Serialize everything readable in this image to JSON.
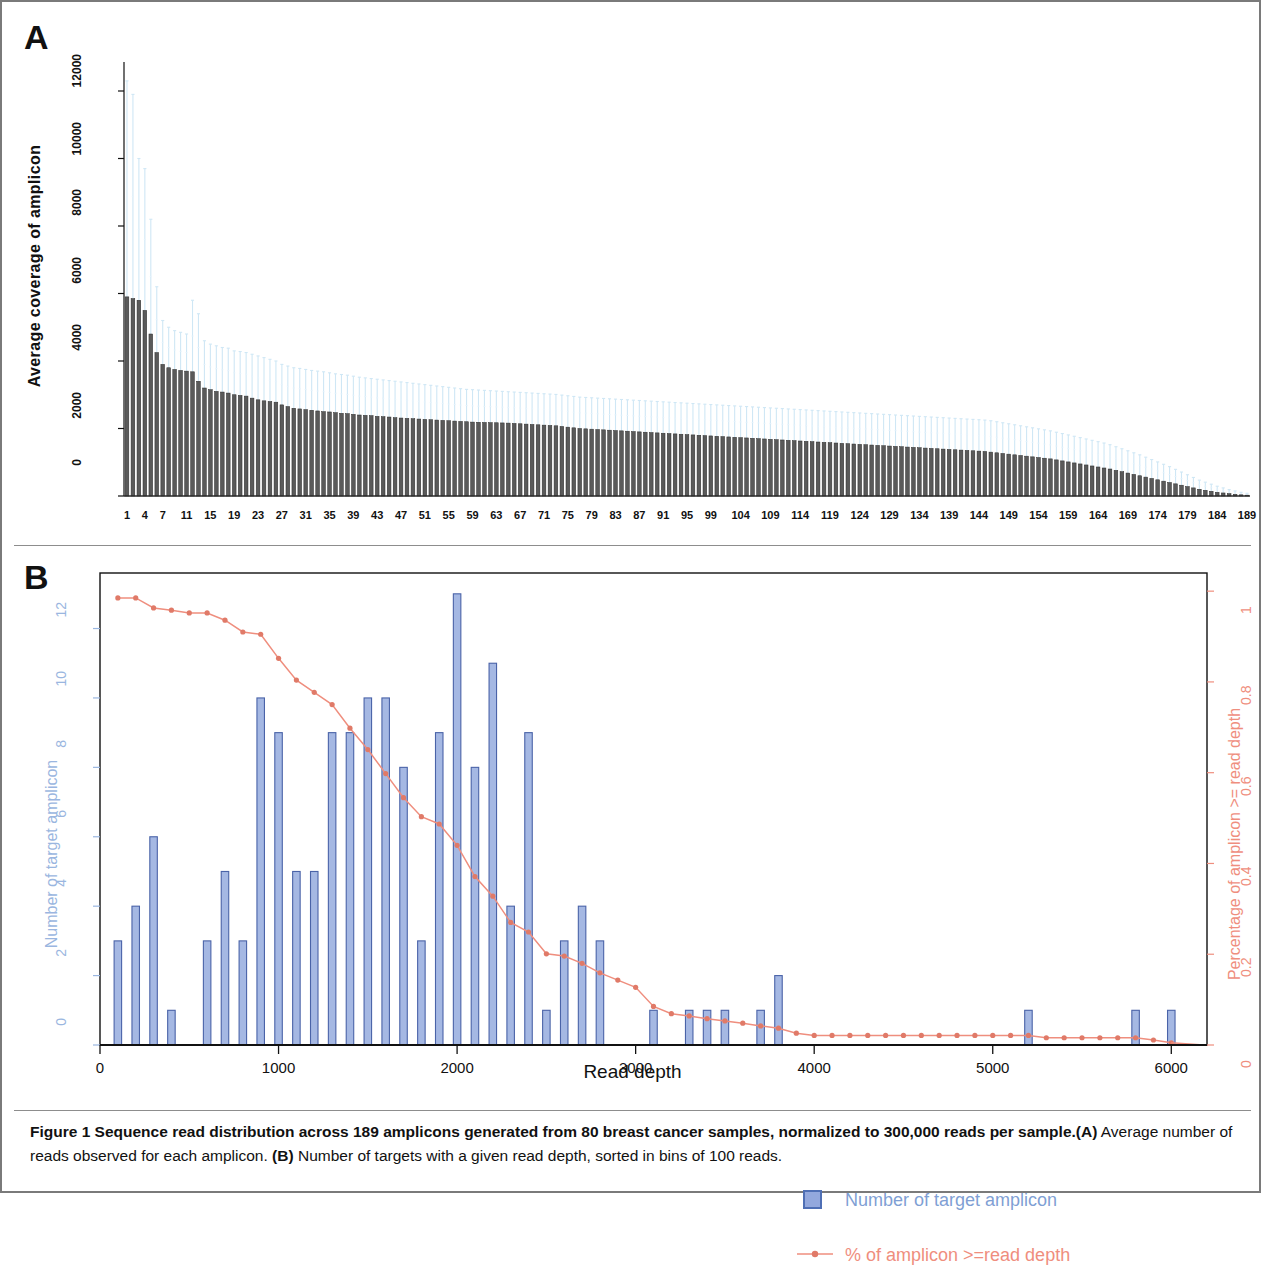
{
  "figure": {
    "panel_a_letter": "A",
    "panel_b_letter": "B",
    "caption_bold": "Figure 1 Sequence read distribution across 189 amplicons generated from 80 breast cancer samples, normalized to 300,000 reads per sample.",
    "caption_part_a_tag": "(A)",
    "caption_part_a_text": " Average number of reads observed for each amplicon. ",
    "caption_part_b_tag": "(B)",
    "caption_part_b_text": " Number of targets with a given read depth, sorted in bins of 100 reads."
  },
  "colors": {
    "bar_fill_a": "#4a4a4a",
    "errorbar_a": "#cfe4f2",
    "bar_fill_b": "#9fb4e2",
    "bar_border_b": "#4a63a8",
    "line_b": "#ef8e7e",
    "axis_left_b": "#9ab6e0",
    "axis_right_b": "#ef8e7e",
    "frame": "#7a7a7a"
  },
  "legend": {
    "bar_label": "Number of target amplicon",
    "line_label": "% of amplicon >=read depth",
    "bar_swatch_icon": "blue-square-icon",
    "line_swatch_icon": "line-with-point-icon"
  },
  "chart_data": [
    {
      "type": "bar",
      "id": "panel-a",
      "title": "",
      "xlabel": "",
      "ylabel": "Average coverage of amplicon",
      "ylim": [
        0,
        12800
      ],
      "yticks": [
        0,
        2000,
        4000,
        6000,
        8000,
        10000,
        12000
      ],
      "ytick_labels": [
        "0",
        "2000",
        "4000",
        "6000",
        "8000",
        "10000",
        "12000"
      ],
      "grid": false,
      "legend_position": "none",
      "error_bars": true,
      "error_bar_note": "Light blue vertical error bars (standard deviation) extend above each bar, reaching up to ~12000 for the first amplicons.",
      "xtick_labels": [
        "1",
        "4",
        "7",
        "11",
        "15",
        "19",
        "23",
        "27",
        "31",
        "35",
        "39",
        "43",
        "47",
        "51",
        "55",
        "59",
        "63",
        "67",
        "71",
        "75",
        "79",
        "83",
        "87",
        "91",
        "95",
        "99",
        "104",
        "109",
        "114",
        "119",
        "124",
        "129",
        "134",
        "139",
        "144",
        "149",
        "154",
        "159",
        "164",
        "169",
        "174",
        "179",
        "184",
        "189"
      ],
      "xtick_values": [
        1,
        4,
        7,
        11,
        15,
        19,
        23,
        27,
        31,
        35,
        39,
        43,
        47,
        51,
        55,
        59,
        63,
        67,
        71,
        75,
        79,
        83,
        87,
        91,
        95,
        99,
        104,
        109,
        114,
        119,
        124,
        129,
        134,
        139,
        144,
        149,
        154,
        159,
        164,
        169,
        174,
        179,
        184,
        189
      ],
      "categories_count": 189,
      "values": [
        5900,
        5850,
        5800,
        5500,
        4800,
        4250,
        3900,
        3800,
        3750,
        3720,
        3700,
        3680,
        3400,
        3200,
        3150,
        3100,
        3080,
        3050,
        3000,
        2980,
        2960,
        2900,
        2850,
        2820,
        2800,
        2780,
        2700,
        2650,
        2600,
        2580,
        2560,
        2540,
        2520,
        2500,
        2490,
        2470,
        2450,
        2440,
        2420,
        2400,
        2390,
        2380,
        2360,
        2350,
        2340,
        2320,
        2310,
        2300,
        2290,
        2280,
        2270,
        2260,
        2250,
        2240,
        2230,
        2220,
        2210,
        2200,
        2190,
        2185,
        2180,
        2175,
        2170,
        2165,
        2160,
        2150,
        2140,
        2130,
        2120,
        2110,
        2100,
        2090,
        2080,
        2060,
        2040,
        2020,
        2000,
        1990,
        1980,
        1970,
        1960,
        1950,
        1940,
        1930,
        1920,
        1910,
        1900,
        1890,
        1880,
        1870,
        1860,
        1850,
        1840,
        1830,
        1820,
        1810,
        1800,
        1790,
        1780,
        1770,
        1760,
        1750,
        1740,
        1730,
        1720,
        1710,
        1700,
        1690,
        1680,
        1670,
        1660,
        1650,
        1640,
        1630,
        1620,
        1610,
        1600,
        1590,
        1580,
        1570,
        1560,
        1550,
        1540,
        1530,
        1520,
        1510,
        1500,
        1490,
        1480,
        1470,
        1460,
        1450,
        1440,
        1430,
        1420,
        1410,
        1400,
        1390,
        1380,
        1370,
        1360,
        1350,
        1340,
        1330,
        1320,
        1300,
        1280,
        1260,
        1240,
        1220,
        1200,
        1180,
        1160,
        1140,
        1120,
        1100,
        1070,
        1040,
        1010,
        980,
        950,
        920,
        890,
        860,
        830,
        800,
        760,
        720,
        680,
        640,
        600,
        560,
        520,
        480,
        440,
        400,
        360,
        320,
        280,
        240,
        200,
        170,
        140,
        110,
        90,
        70,
        50,
        35,
        25
      ],
      "errors_upper": [
        12300,
        11900,
        10000,
        9700,
        8200,
        6200,
        5200,
        5000,
        4900,
        4850,
        4800,
        5800,
        5400,
        4600,
        4500,
        4450,
        4400,
        4380,
        4300,
        4280,
        4250,
        4200,
        4150,
        4100,
        4050,
        4000,
        3900,
        3850,
        3800,
        3780,
        3750,
        3720,
        3700,
        3680,
        3650,
        3620,
        3600,
        3580,
        3550,
        3520,
        3500,
        3480,
        3460,
        3440,
        3420,
        3400,
        3380,
        3360,
        3340,
        3320,
        3300,
        3280,
        3260,
        3240,
        3220,
        3200,
        3180,
        3160,
        3150,
        3140,
        3130,
        3120,
        3110,
        3100,
        3090,
        3080,
        3070,
        3060,
        3050,
        3040,
        3030,
        3020,
        3010,
        2990,
        2970,
        2950,
        2930,
        2920,
        2910,
        2900,
        2890,
        2880,
        2870,
        2860,
        2850,
        2840,
        2830,
        2820,
        2810,
        2800,
        2790,
        2780,
        2770,
        2760,
        2750,
        2740,
        2730,
        2720,
        2710,
        2700,
        2690,
        2680,
        2670,
        2660,
        2650,
        2640,
        2630,
        2620,
        2610,
        2600,
        2590,
        2580,
        2570,
        2560,
        2550,
        2540,
        2530,
        2520,
        2510,
        2500,
        2490,
        2480,
        2470,
        2460,
        2450,
        2440,
        2430,
        2420,
        2410,
        2400,
        2390,
        2380,
        2370,
        2360,
        2350,
        2340,
        2330,
        2320,
        2310,
        2300,
        2290,
        2280,
        2270,
        2260,
        2250,
        2230,
        2200,
        2170,
        2140,
        2110,
        2080,
        2050,
        2020,
        1990,
        1960,
        1930,
        1890,
        1850,
        1810,
        1770,
        1730,
        1690,
        1650,
        1610,
        1570,
        1520,
        1460,
        1400,
        1340,
        1280,
        1220,
        1150,
        1080,
        1010,
        940,
        870,
        790,
        710,
        630,
        550,
        470,
        410,
        350,
        290,
        240,
        190,
        150,
        110,
        80
      ]
    },
    {
      "type": "bar",
      "id": "panel-b",
      "title": "",
      "xlabel": "Read depth",
      "ylabel": "Number of target amplicon",
      "ylabel_right": "Percentage of amplicon >= read depth",
      "xlim": [
        0,
        6200
      ],
      "ylim": [
        0,
        13.6
      ],
      "ylim_right": [
        0,
        1.04
      ],
      "xticks": [
        0,
        1000,
        2000,
        3000,
        4000,
        5000,
        6000
      ],
      "xtick_labels": [
        "0",
        "1000",
        "2000",
        "3000",
        "4000",
        "5000",
        "6000"
      ],
      "yticks": [
        0,
        2,
        4,
        6,
        8,
        10,
        12
      ],
      "ytick_labels": [
        "0",
        "2",
        "4",
        "6",
        "8",
        "10",
        "12"
      ],
      "yticks_right": [
        0,
        0.2,
        0.4,
        0.6,
        0.8,
        1
      ],
      "ytick_labels_right": [
        "0",
        "0.2",
        "0.4",
        "0.6",
        "0.8",
        "1"
      ],
      "grid": false,
      "legend_position": "upper-right-inside",
      "bin_width": 100,
      "bins": [
        100,
        200,
        300,
        400,
        500,
        600,
        700,
        800,
        900,
        1000,
        1100,
        1200,
        1300,
        1400,
        1500,
        1600,
        1700,
        1800,
        1900,
        2000,
        2100,
        2200,
        2300,
        2400,
        2500,
        2600,
        2700,
        2800,
        2900,
        3000,
        3100,
        3200,
        3300,
        3400,
        3500,
        3600,
        3700,
        3800,
        3900,
        4000,
        4100,
        4200,
        4300,
        4400,
        4500,
        4600,
        4700,
        4800,
        4900,
        5000,
        5100,
        5200,
        5300,
        5400,
        5500,
        5600,
        5700,
        5800,
        5900,
        6000
      ],
      "values": [
        3,
        4,
        6,
        1,
        0,
        3,
        5,
        3,
        10,
        9,
        5,
        5,
        9,
        9,
        10,
        10,
        8,
        3,
        9,
        13,
        8,
        11,
        4,
        9,
        1,
        3,
        4,
        3,
        0,
        0,
        1,
        0,
        1,
        1,
        1,
        0,
        1,
        2,
        0,
        0,
        0,
        0,
        0,
        0,
        0,
        0,
        0,
        0,
        0,
        0,
        0,
        1,
        0,
        0,
        0,
        0,
        0,
        1,
        0,
        1
      ],
      "series": [
        {
          "name": "Number of target amplicon",
          "type": "bar",
          "axis": "left",
          "color": "#9fb4e2",
          "values": [
            3,
            4,
            6,
            1,
            0,
            3,
            5,
            3,
            10,
            9,
            5,
            5,
            9,
            9,
            10,
            10,
            8,
            3,
            9,
            13,
            8,
            11,
            4,
            9,
            1,
            3,
            4,
            3,
            0,
            0,
            1,
            0,
            1,
            1,
            1,
            0,
            1,
            2,
            0,
            0,
            0,
            0,
            0,
            0,
            0,
            0,
            0,
            0,
            0,
            0,
            0,
            1,
            0,
            0,
            0,
            0,
            0,
            1,
            0,
            1
          ]
        },
        {
          "name": "% of amplicon >=read depth",
          "type": "line",
          "axis": "right",
          "color": "#ef8e7e",
          "values": [
            0.985,
            0.985,
            0.963,
            0.958,
            0.952,
            0.952,
            0.936,
            0.91,
            0.905,
            0.852,
            0.804,
            0.777,
            0.75,
            0.698,
            0.651,
            0.598,
            0.545,
            0.503,
            0.487,
            0.44,
            0.371,
            0.328,
            0.27,
            0.249,
            0.201,
            0.196,
            0.18,
            0.159,
            0.143,
            0.127,
            0.085,
            0.069,
            0.064,
            0.058,
            0.053,
            0.048,
            0.042,
            0.037,
            0.026,
            0.021,
            0.021,
            0.021,
            0.021,
            0.021,
            0.021,
            0.021,
            0.021,
            0.021,
            0.021,
            0.021,
            0.021,
            0.021,
            0.016,
            0.016,
            0.016,
            0.016,
            0.016,
            0.016,
            0.011,
            0.005
          ]
        }
      ]
    }
  ]
}
